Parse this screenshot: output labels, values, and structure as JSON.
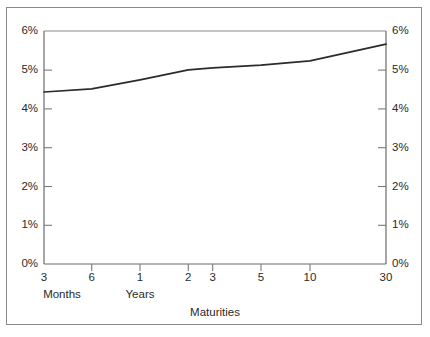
{
  "chart_data": {
    "type": "line",
    "title": "",
    "xlabel": "Maturities",
    "ylabel": "",
    "categories": [
      "3",
      "6",
      "1",
      "2",
      "3",
      "5",
      "10",
      "30"
    ],
    "x_group_labels": [
      "Months",
      "Years"
    ],
    "values": [
      4.43,
      4.51,
      4.74,
      5.0,
      5.05,
      5.12,
      5.23,
      5.66
    ],
    "ylim": [
      0,
      6
    ],
    "ytick_labels_left": [
      "6%",
      "5%",
      "4%",
      "3%",
      "2%",
      "1%",
      "0%"
    ],
    "ytick_labels_right": [
      "6%",
      "5%",
      "4%",
      "3%",
      "2%",
      "1%",
      "0%"
    ],
    "ytick_values": [
      6,
      5,
      4,
      3,
      2,
      1,
      0
    ],
    "grid": false,
    "legend": null,
    "line_color": "#2b2b2b",
    "axis_color": "#8a8a8a",
    "background_color": "#ffffff"
  },
  "axes": {
    "left_ticks": [
      {
        "label": "6%",
        "value": 6
      },
      {
        "label": "5%",
        "value": 5
      },
      {
        "label": "4%",
        "value": 4
      },
      {
        "label": "3%",
        "value": 3
      },
      {
        "label": "2%",
        "value": 2
      },
      {
        "label": "1%",
        "value": 1
      },
      {
        "label": "0%",
        "value": 0
      }
    ],
    "right_ticks": [
      {
        "label": "6%",
        "value": 6
      },
      {
        "label": "5%",
        "value": 5
      },
      {
        "label": "4%",
        "value": 4
      },
      {
        "label": "3%",
        "value": 3
      },
      {
        "label": "2%",
        "value": 2
      },
      {
        "label": "1%",
        "value": 1
      },
      {
        "label": "0%",
        "value": 0
      }
    ],
    "x_ticks": [
      {
        "label": "3",
        "value": 0.25,
        "group": "Months"
      },
      {
        "label": "6",
        "value": 0.5,
        "group": "Months"
      },
      {
        "label": "1",
        "value": 1,
        "group": "Years"
      },
      {
        "label": "2",
        "value": 2,
        "group": "Years"
      },
      {
        "label": "3",
        "value": 3,
        "group": "Years"
      },
      {
        "label": "5",
        "value": 5,
        "group": "Years"
      },
      {
        "label": "10",
        "value": 10,
        "group": "Years"
      },
      {
        "label": "30",
        "value": 30,
        "group": "Years"
      }
    ],
    "group_label_months": "Months",
    "group_label_years": "Years",
    "x_axis_title": "Maturities"
  }
}
